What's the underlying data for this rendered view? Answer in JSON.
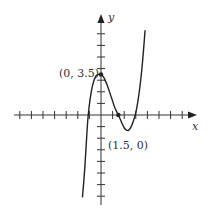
{
  "chart_data": {
    "type": "line",
    "title": "",
    "xlabel": "x",
    "ylabel": "y",
    "grid": false,
    "legend": null,
    "axis_ticks": {
      "x_min": -7,
      "x_max": 7,
      "y_min": -7,
      "y_max": 7,
      "step": 1,
      "tick_labels": false
    },
    "series": [
      {
        "name": "f(x) cubic",
        "description": "Cubic with local maximum at (0, 3.5), x-intercepts near -1.1, 1.5 and 3, local minimum near (2.2, -1.3)",
        "x": [
          -1.6,
          -1.4,
          -1.2,
          -1.1,
          -1.0,
          -0.8,
          -0.6,
          -0.4,
          -0.2,
          0.0,
          0.2,
          0.4,
          0.6,
          0.8,
          1.0,
          1.2,
          1.5,
          1.8,
          2.0,
          2.2,
          2.4,
          2.6,
          2.8,
          3.0,
          3.2,
          3.4,
          3.6,
          3.8
        ],
        "y": [
          -7.1,
          -4.6,
          -1.3,
          0.0,
          0.9,
          2.2,
          3.0,
          3.4,
          3.5,
          3.5,
          3.3,
          2.9,
          2.4,
          1.8,
          1.2,
          0.6,
          0.0,
          -0.7,
          -1.1,
          -1.3,
          -1.3,
          -1.0,
          -0.5,
          0.2,
          1.3,
          2.8,
          4.8,
          7.3
        ]
      }
    ],
    "points": [
      {
        "x": 0,
        "y": 3.5,
        "label": "(0, 3.5)"
      },
      {
        "x": 1.5,
        "y": 0,
        "label": "(1.5, 0)"
      }
    ]
  },
  "labels": {
    "x_axis": "x",
    "y_axis": "y",
    "point_max": "(0, 3.5)",
    "point_root": "(1.5, 0)"
  }
}
